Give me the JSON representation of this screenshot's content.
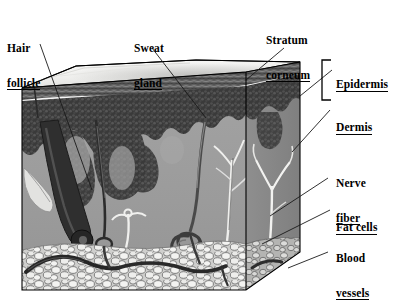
{
  "figure": {
    "view": "three-dimensional cut-away block"
  },
  "labels": {
    "hair_follicle": {
      "line1": "Hair",
      "line2": "follicle"
    },
    "sweat_gland": {
      "line1": "Sweat",
      "line2": "gland"
    },
    "stratum_corneum": {
      "line1": "Stratum",
      "line2": "corneum"
    },
    "epidermis": {
      "line1": "Epidermis"
    },
    "dermis": {
      "line1": "Dermis"
    },
    "nerve_fiber": {
      "line1": "Nerve",
      "line2": "fiber"
    },
    "fat_cells": {
      "line1": "Fat cells"
    },
    "blood_vessels": {
      "line1": "Blood",
      "line2": "vessels"
    }
  },
  "colors": {
    "background": "#ffffff",
    "top_surface": "#f2f2f0",
    "top_surface_shadow": "#d8d8d6",
    "epidermis_band": "#5f5f5f",
    "epidermis_line": "#ffffff",
    "dermis_stipple": "#3a3a3a",
    "dermis_body": "#9d9d9d",
    "side_face": "#8a8a8a",
    "fat_cells": "#ececea",
    "fat_outline": "#6b6b6b",
    "vessel_dark": "#2e2e2e",
    "nerve_light": "#f0f0ee",
    "outline": "#000000",
    "leader_line": "#1a1a1a"
  },
  "structures": [
    {
      "name": "stratum-corneum",
      "description": "outer horny layer band at top of block"
    },
    {
      "name": "epidermis",
      "description": "upper striated layer beneath surface"
    },
    {
      "name": "dermis",
      "description": "thick middle layer with dark stippled papillae"
    },
    {
      "name": "hair-follicle",
      "description": "dark shaft descending into dermis with bulb"
    },
    {
      "name": "sweat-gland",
      "description": "coiled duct tube ending in a spiral coil"
    },
    {
      "name": "nerve-fiber",
      "description": "pale branching filament in the dermis"
    },
    {
      "name": "fat-cells",
      "description": "layer of rounded cells at the base"
    },
    {
      "name": "blood-vessels",
      "description": "dark arching vessels within the fat layer"
    }
  ]
}
